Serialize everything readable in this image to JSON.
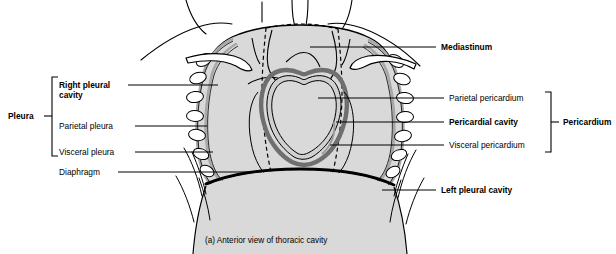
{
  "figure": {
    "caption": "(a) Anterior view of thoracic cavity",
    "colors": {
      "cavity_fill": "#d9d9d9",
      "serosa_band": "#a8a8a8",
      "outline": "#000000",
      "background": "#ffffff"
    }
  },
  "brackets": {
    "left": {
      "label": "Pleura"
    },
    "right": {
      "label": "Pericardium"
    }
  },
  "labels": {
    "left": [
      {
        "id": "right-pleural-cavity",
        "line1": "Right pleural",
        "line2": "cavity",
        "bold": true
      },
      {
        "id": "parietal-pleura",
        "line1": "Parietal pleura",
        "bold": false
      },
      {
        "id": "visceral-pleura",
        "line1": "Visceral pleura",
        "bold": false
      },
      {
        "id": "diaphragm",
        "line1": "Diaphragm",
        "bold": false
      }
    ],
    "right": [
      {
        "id": "mediastinum",
        "line1": "Mediastinum",
        "bold": true
      },
      {
        "id": "parietal-pericardium",
        "line1": "Parietal pericardium",
        "bold": false
      },
      {
        "id": "pericardial-cavity",
        "line1": "Pericardial cavity",
        "bold": true
      },
      {
        "id": "visceral-pericardium",
        "line1": "Visceral pericardium",
        "bold": false
      },
      {
        "id": "left-pleural-cavity",
        "line1": "Left pleural cavity",
        "bold": true
      }
    ]
  }
}
